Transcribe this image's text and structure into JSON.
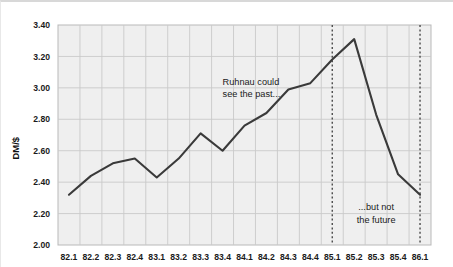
{
  "chart_data": {
    "type": "line",
    "title": "",
    "subtitle": "",
    "xlabel": "",
    "ylabel": "DM/$",
    "ylim": [
      2.0,
      3.4
    ],
    "ytick_step": 0.2,
    "yticks": [
      "2.00",
      "2.20",
      "2.40",
      "2.60",
      "2.80",
      "3.00",
      "3.20",
      "3.40"
    ],
    "grid": true,
    "grid_color": "#c9c9c9",
    "plot_bgcolor": "#efefef",
    "line_color": "#3a3a3a",
    "legend": [],
    "legend_position": "none",
    "categories": [
      "82.1",
      "82.2",
      "82.3",
      "82.4",
      "83.1",
      "83.2",
      "83.3",
      "83.4",
      "84.1",
      "84.2",
      "84.3",
      "84.4",
      "85.1",
      "85.2",
      "85.3",
      "85.4",
      "86.1"
    ],
    "values": [
      2.32,
      2.44,
      2.52,
      2.55,
      2.43,
      2.55,
      2.71,
      2.6,
      2.76,
      2.84,
      2.99,
      3.03,
      3.18,
      3.31,
      2.83,
      2.45,
      2.32
    ],
    "series": [
      {
        "name": "DM/$ exchange rate",
        "values": [
          2.32,
          2.44,
          2.52,
          2.55,
          2.43,
          2.55,
          2.71,
          2.6,
          2.76,
          2.84,
          2.99,
          3.03,
          3.18,
          3.31,
          2.83,
          2.45,
          2.32
        ]
      }
    ],
    "annotations": [
      {
        "text_line1": "Ruhnau could",
        "text_line2": "see the past...",
        "x_category": "83.4",
        "y_value": 3.02,
        "align": "left"
      },
      {
        "text_line1": "...but not",
        "text_line2": "the future",
        "x_category": "85.3",
        "y_value": 2.22,
        "align": "center"
      }
    ],
    "vlines": [
      {
        "x_category": "85.1",
        "style": "dotted",
        "color": "#4a4a4a"
      },
      {
        "x_category": "86.1",
        "style": "dotted",
        "color": "#4a4a4a"
      }
    ]
  }
}
